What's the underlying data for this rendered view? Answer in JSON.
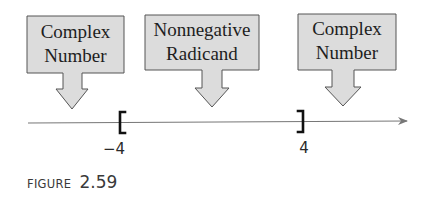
{
  "callouts": [
    {
      "line1": "Complex",
      "line2": "Number"
    },
    {
      "line1": "Nonnegative",
      "line2": "Radicand"
    },
    {
      "line1": "Complex",
      "line2": "Number"
    }
  ],
  "number_line": {
    "left_endpoint": {
      "value": "−4",
      "bracket": "["
    },
    "right_endpoint": {
      "value": "4",
      "bracket": "]"
    }
  },
  "caption": {
    "prefix": "FIGURE",
    "number": "2.59"
  },
  "colors": {
    "box_fill": "#dcdcdc",
    "box_stroke": "#555555",
    "line": "#777777",
    "bracket": "#111111"
  }
}
